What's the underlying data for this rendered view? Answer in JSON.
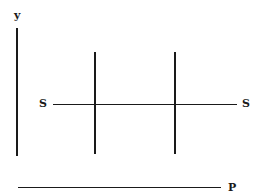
{
  "diagram": {
    "axis_y_label": "y",
    "axis_x_label": "P",
    "horizontal_line_left_label": "S",
    "horizontal_line_right_label": "S",
    "line_color": "#1a1a1a",
    "background": "#ffffff"
  }
}
